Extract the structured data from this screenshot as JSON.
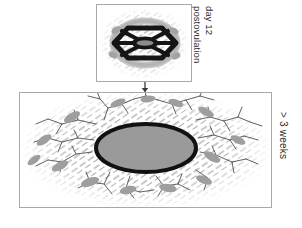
{
  "figure": {
    "type": "biomedical-schematic-diagram",
    "background_color": "#ffffff",
    "width": 302,
    "height": 228,
    "panels": [
      {
        "id": "top-panel",
        "name": "day-12-postovulation-panel",
        "x": 96,
        "y": 4,
        "width": 96,
        "height": 78,
        "border_color": "#a8a8a8",
        "fill_color": "#ffffff",
        "label_lines": [
          "day 12",
          "postovulation"
        ],
        "content_description": "small implantation site with dark radial spoke pattern and central oval surrounded by gray halo and diagonal stromal hatching",
        "central_oval": {
          "cx": 145,
          "cy": 42,
          "rx": 11,
          "ry": 5,
          "fill": "#8c8c8c",
          "stroke": "#111111"
        },
        "spoke_count": 6,
        "halo_fill": "#bdbdbd"
      },
      {
        "id": "bottom-panel",
        "name": "greater-than-3-weeks-panel",
        "x": 19,
        "y": 92,
        "width": 253,
        "height": 116,
        "border_color": "#a8a8a8",
        "fill_color": "#ffffff",
        "label_lines": [
          "> 3 weeks"
        ],
        "content_description": "large expanded implantation site with thick black outlined gray oval, extensive branching vascular network, gray glandular blobs and dense diagonal stromal hatching",
        "central_oval": {
          "cx": 146,
          "cy": 148,
          "rx": 50,
          "ry": 24,
          "fill": "#9a9a9a",
          "stroke": "#111111",
          "stroke_width": 4
        },
        "branch_count": 38,
        "blob_count": 14
      }
    ],
    "arrow": {
      "name": "progression-arrow",
      "x": 145,
      "y_start": 82,
      "y_end": 92,
      "color": "#3a3a3a",
      "direction": "down",
      "meaning": "temporal progression from day 12 postovulation to greater than 3 weeks"
    },
    "labels": {
      "top_line_1": "day 12",
      "top_line_2": "postovulation",
      "bottom": "> 3 weeks"
    },
    "colors": {
      "panel_border": "#a8a8a8",
      "outline_black": "#111111",
      "oval_gray": "#9a9a9a",
      "blob_gray": "#9e9e9e",
      "halo_gray": "#bdbdbd",
      "hatch_gray": "#8a8a8a",
      "vessel_gray": "#4a4a4a",
      "text": "#2b2b2b",
      "background": "#ffffff"
    }
  }
}
